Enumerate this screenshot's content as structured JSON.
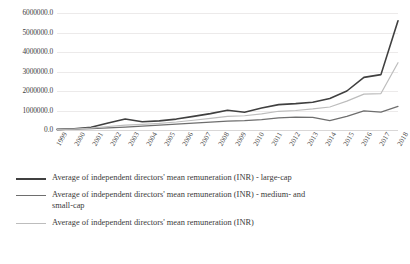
{
  "chart_data": {
    "type": "line",
    "title": "",
    "xlabel": "",
    "ylabel": "",
    "ylim": [
      0,
      6000000
    ],
    "grid": true,
    "legend_position": "bottom",
    "categories": [
      "1999",
      "2000",
      "2001",
      "2002",
      "2003",
      "2004",
      "2005",
      "2006",
      "2007",
      "2008",
      "2009",
      "2010",
      "2011",
      "2012",
      "2013",
      "2014",
      "2015",
      "2016",
      "2017",
      "2018"
    ],
    "y_ticks": [
      "0.0",
      "1000000.0",
      "2000000.0",
      "3000000.0",
      "4000000.0",
      "5000000.0",
      "6000000.0"
    ],
    "y_tick_values": [
      0,
      1000000,
      2000000,
      3000000,
      4000000,
      5000000,
      6000000
    ],
    "series": [
      {
        "name": "Average of independent directors' mean remuneration (INR)  - large-cap",
        "color": "#404040",
        "values": [
          30000,
          60000,
          140000,
          360000,
          560000,
          420000,
          470000,
          560000,
          700000,
          840000,
          1010000,
          910000,
          1130000,
          1300000,
          1350000,
          1420000,
          1620000,
          2000000,
          2700000,
          2840000
        ]
      },
      {
        "name": "Average of independent directors' mean remuneration (INR) - medium- and small-cap",
        "color": "#6e6e6e",
        "values": [
          20000,
          40000,
          70000,
          110000,
          150000,
          200000,
          250000,
          300000,
          350000,
          400000,
          450000,
          480000,
          530000,
          620000,
          660000,
          650000,
          480000,
          700000,
          980000,
          920000
        ]
      },
      {
        "name": "Average of independent directors' mean remuneration (INR)",
        "color": "#bdbdbd",
        "values": [
          25000,
          50000,
          100000,
          180000,
          250000,
          290000,
          340000,
          410000,
          500000,
          600000,
          700000,
          730000,
          830000,
          960000,
          1000000,
          1080000,
          1180000,
          1480000,
          1840000,
          1870000
        ]
      }
    ],
    "final_points": {
      "large_cap_2018": 5600000,
      "medium_small_cap_2018": 1210000,
      "overall_2018": 3450000
    }
  }
}
